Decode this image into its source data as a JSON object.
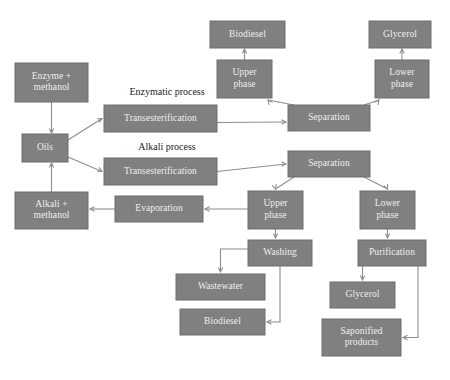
{
  "diagram": {
    "type": "process-flowchart",
    "canvas": {
      "width": 450,
      "height": 380
    },
    "colors": {
      "node_fill": "#808080",
      "node_text": "#efefef",
      "edge": "#8d8d8d",
      "process_label_text": "#1a1a1a",
      "background": "#ffffff"
    },
    "process_labels": [
      {
        "id": "enzymatic-process-label",
        "text": "Enzymatic process",
        "x": 167,
        "y": 93
      },
      {
        "id": "alkali-process-label",
        "text": "Alkali process",
        "x": 167,
        "y": 148
      }
    ],
    "nodes": [
      {
        "id": "enzyme-methanol",
        "lines": [
          "Enzyme +",
          "methanol"
        ],
        "x": 15,
        "y": 63,
        "w": 73,
        "h": 39
      },
      {
        "id": "oils",
        "lines": [
          "Oils"
        ],
        "x": 22,
        "y": 134,
        "w": 46,
        "h": 28
      },
      {
        "id": "alkali-methanol",
        "lines": [
          "Alkali +",
          "methanol"
        ],
        "x": 15,
        "y": 192,
        "w": 73,
        "h": 37
      },
      {
        "id": "transesterification-enzymatic",
        "lines": [
          "Transesterification"
        ],
        "x": 104,
        "y": 105,
        "w": 113,
        "h": 27
      },
      {
        "id": "transesterification-alkali",
        "lines": [
          "Transesterification"
        ],
        "x": 104,
        "y": 158,
        "w": 113,
        "h": 27
      },
      {
        "id": "separation-enzymatic",
        "lines": [
          "Separation"
        ],
        "x": 288,
        "y": 105,
        "w": 82,
        "h": 26
      },
      {
        "id": "separation-alkali",
        "lines": [
          "Separation"
        ],
        "x": 288,
        "y": 151,
        "w": 82,
        "h": 26
      },
      {
        "id": "upper-phase-enzymatic",
        "lines": [
          "Upper",
          "phase"
        ],
        "x": 217,
        "y": 60,
        "w": 55,
        "h": 38
      },
      {
        "id": "lower-phase-enzymatic",
        "lines": [
          "Lower",
          "phase"
        ],
        "x": 375,
        "y": 60,
        "w": 54,
        "h": 38
      },
      {
        "id": "biodiesel-enzymatic",
        "lines": [
          "Biodiesel"
        ],
        "x": 210,
        "y": 21,
        "w": 75,
        "h": 27
      },
      {
        "id": "glycerol-enzymatic",
        "lines": [
          "Glycerol"
        ],
        "x": 369,
        "y": 21,
        "w": 62,
        "h": 27
      },
      {
        "id": "upper-phase-alkali",
        "lines": [
          "Upper",
          "phase"
        ],
        "x": 248,
        "y": 191,
        "w": 55,
        "h": 38
      },
      {
        "id": "lower-phase-alkali",
        "lines": [
          "Lower",
          "phase"
        ],
        "x": 360,
        "y": 191,
        "w": 55,
        "h": 38
      },
      {
        "id": "evaporation",
        "lines": [
          "Evaporation"
        ],
        "x": 115,
        "y": 196,
        "w": 88,
        "h": 26
      },
      {
        "id": "washing",
        "lines": [
          "Washing"
        ],
        "x": 248,
        "y": 240,
        "w": 64,
        "h": 26
      },
      {
        "id": "purification",
        "lines": [
          "Purification"
        ],
        "x": 358,
        "y": 240,
        "w": 68,
        "h": 26
      },
      {
        "id": "wastewater",
        "lines": [
          "Wastewater"
        ],
        "x": 176,
        "y": 274,
        "w": 89,
        "h": 26
      },
      {
        "id": "biodiesel-alkali",
        "lines": [
          "Biodiesel"
        ],
        "x": 180,
        "y": 309,
        "w": 85,
        "h": 26
      },
      {
        "id": "glycerol-alkali",
        "lines": [
          "Glycerol"
        ],
        "x": 330,
        "y": 282,
        "w": 65,
        "h": 26
      },
      {
        "id": "saponified-products",
        "lines": [
          "Saponified",
          "products"
        ],
        "x": 322,
        "y": 319,
        "w": 79,
        "h": 37
      }
    ],
    "edges": [
      {
        "id": "edge-enzyme-to-oils",
        "from": "enzyme-methanol",
        "to": "oils"
      },
      {
        "id": "edge-alkali-to-oils",
        "from": "alkali-methanol",
        "to": "oils"
      },
      {
        "id": "edge-oils-to-transesterification-enzymatic",
        "from": "oils",
        "to": "transesterification-enzymatic"
      },
      {
        "id": "edge-oils-to-transesterification-alkali",
        "from": "oils",
        "to": "transesterification-alkali"
      },
      {
        "id": "edge-transesterification-enzymatic-to-separation",
        "from": "transesterification-enzymatic",
        "to": "separation-enzymatic"
      },
      {
        "id": "edge-transesterification-alkali-to-separation",
        "from": "transesterification-alkali",
        "to": "separation-alkali"
      },
      {
        "id": "edge-separation-to-upper-phase-enzymatic",
        "from": "separation-enzymatic",
        "to": "upper-phase-enzymatic"
      },
      {
        "id": "edge-separation-to-lower-phase-enzymatic",
        "from": "separation-enzymatic",
        "to": "lower-phase-enzymatic"
      },
      {
        "id": "edge-upper-phase-to-biodiesel-enzymatic",
        "from": "upper-phase-enzymatic",
        "to": "biodiesel-enzymatic"
      },
      {
        "id": "edge-lower-phase-to-glycerol-enzymatic",
        "from": "lower-phase-enzymatic",
        "to": "glycerol-enzymatic"
      },
      {
        "id": "edge-separation-to-upper-phase-alkali",
        "from": "separation-alkali",
        "to": "upper-phase-alkali"
      },
      {
        "id": "edge-separation-to-lower-phase-alkali",
        "from": "separation-alkali",
        "to": "lower-phase-alkali"
      },
      {
        "id": "edge-upper-phase-to-evaporation",
        "from": "upper-phase-alkali",
        "to": "evaporation"
      },
      {
        "id": "edge-evaporation-to-alkali-methanol",
        "from": "evaporation",
        "to": "alkali-methanol"
      },
      {
        "id": "edge-upper-phase-to-washing",
        "from": "upper-phase-alkali",
        "to": "washing"
      },
      {
        "id": "edge-washing-to-wastewater",
        "from": "washing",
        "to": "wastewater"
      },
      {
        "id": "edge-washing-to-biodiesel",
        "from": "washing",
        "to": "biodiesel-alkali"
      },
      {
        "id": "edge-lower-phase-to-purification",
        "from": "lower-phase-alkali",
        "to": "purification"
      },
      {
        "id": "edge-purification-to-glycerol",
        "from": "purification",
        "to": "glycerol-alkali"
      },
      {
        "id": "edge-purification-to-saponified-products",
        "from": "purification",
        "to": "saponified-products"
      }
    ]
  }
}
